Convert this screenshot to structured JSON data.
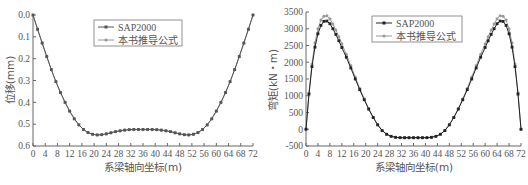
{
  "chart_data": [
    {
      "type": "line",
      "title": "",
      "xlabel": "系梁轴向坐标(m)",
      "ylabel": "位移(mm)",
      "xlim": [
        0,
        72
      ],
      "ylim": [
        0.0,
        0.6
      ],
      "y_inverted": true,
      "grid": false,
      "legend_position": "upper center",
      "x_ticks": [
        "0",
        "4",
        "8",
        "12",
        "16",
        "20",
        "24",
        "28",
        "32",
        "36",
        "40",
        "44",
        "48",
        "52",
        "56",
        "60",
        "64",
        "68",
        "72"
      ],
      "y_ticks": [
        "0.0",
        "0.1",
        "0.2",
        "0.3",
        "0.4",
        "0.5",
        "0.6"
      ],
      "x": [
        0,
        1.5,
        3,
        4.5,
        6,
        7.5,
        9,
        10.5,
        12,
        13.5,
        15,
        16.5,
        18,
        19.5,
        21,
        22.5,
        24,
        25.5,
        27,
        28.5,
        30,
        31.5,
        33,
        34.5,
        36,
        37.5,
        39,
        40.5,
        42,
        43.5,
        45,
        46.5,
        48,
        49.5,
        51,
        52.5,
        54,
        55.5,
        57,
        58.5,
        60,
        61.5,
        63,
        64.5,
        66,
        67.5,
        69,
        70.5,
        72
      ],
      "series": [
        {
          "name": "SAP2000",
          "marker": "square",
          "color": "#555555",
          "values": [
            0.0,
            0.065,
            0.128,
            0.19,
            0.25,
            0.305,
            0.355,
            0.4,
            0.44,
            0.475,
            0.503,
            0.524,
            0.538,
            0.546,
            0.549,
            0.548,
            0.544,
            0.539,
            0.534,
            0.53,
            0.527,
            0.525,
            0.524,
            0.524,
            0.524,
            0.524,
            0.524,
            0.525,
            0.527,
            0.53,
            0.534,
            0.539,
            0.544,
            0.548,
            0.549,
            0.546,
            0.538,
            0.524,
            0.503,
            0.475,
            0.44,
            0.4,
            0.355,
            0.305,
            0.25,
            0.19,
            0.128,
            0.065,
            0.0
          ]
        },
        {
          "name": "本书推导公式",
          "marker": "circle",
          "color": "#999999",
          "values": [
            0.0,
            0.066,
            0.129,
            0.191,
            0.251,
            0.306,
            0.356,
            0.401,
            0.441,
            0.476,
            0.504,
            0.525,
            0.539,
            0.547,
            0.55,
            0.549,
            0.545,
            0.54,
            0.535,
            0.531,
            0.528,
            0.526,
            0.525,
            0.525,
            0.525,
            0.525,
            0.525,
            0.526,
            0.528,
            0.531,
            0.535,
            0.54,
            0.545,
            0.549,
            0.55,
            0.547,
            0.539,
            0.525,
            0.504,
            0.476,
            0.441,
            0.401,
            0.356,
            0.306,
            0.251,
            0.191,
            0.129,
            0.066,
            0.0
          ]
        }
      ]
    },
    {
      "type": "line",
      "title": "",
      "xlabel": "系梁轴向坐标(m)",
      "ylabel": "弯矩(kN・m)",
      "xlim": [
        0,
        72
      ],
      "ylim": [
        -500,
        3500
      ],
      "grid": false,
      "legend_position": "upper center",
      "x_ticks": [
        "0",
        "4",
        "8",
        "12",
        "16",
        "20",
        "24",
        "28",
        "32",
        "36",
        "40",
        "44",
        "48",
        "52",
        "56",
        "60",
        "64",
        "68",
        "72"
      ],
      "y_ticks": [
        "-500",
        "0",
        "500",
        "1000",
        "1500",
        "2000",
        "2500",
        "3000",
        "3500"
      ],
      "x": [
        0,
        1,
        2,
        3,
        4,
        5,
        6,
        7,
        8,
        9,
        10,
        11,
        12,
        13.5,
        15,
        16.5,
        18,
        19.5,
        21,
        22.5,
        24,
        25.5,
        27,
        28.5,
        30,
        31.5,
        33,
        34.5,
        36,
        37.5,
        39,
        40.5,
        42,
        43.5,
        45,
        46.5,
        48,
        49.5,
        51,
        52.5,
        54,
        55.5,
        57,
        58.5,
        60,
        61,
        62,
        63,
        64,
        65,
        66,
        67,
        68,
        69,
        70,
        71,
        72
      ],
      "series": [
        {
          "name": "SAP2000",
          "marker": "square",
          "color": "#222222",
          "values": [
            0,
            1050,
            1870,
            2450,
            2850,
            3100,
            3220,
            3230,
            3150,
            3000,
            2830,
            2640,
            2440,
            2150,
            1830,
            1500,
            1180,
            880,
            600,
            350,
            130,
            -40,
            -150,
            -210,
            -240,
            -250,
            -250,
            -250,
            -250,
            -250,
            -250,
            -250,
            -240,
            -210,
            -150,
            -40,
            130,
            350,
            600,
            880,
            1180,
            1500,
            1830,
            2150,
            2440,
            2640,
            2830,
            3000,
            3150,
            3230,
            3220,
            3100,
            2850,
            2450,
            1870,
            1050,
            0
          ]
        },
        {
          "name": "本书推导公式",
          "marker": "circle",
          "color": "#999999",
          "values": [
            0,
            1080,
            1950,
            2580,
            3000,
            3260,
            3370,
            3390,
            3300,
            3140,
            2960,
            2760,
            2550,
            2240,
            1900,
            1560,
            1220,
            910,
            620,
            360,
            140,
            -35,
            -150,
            -215,
            -245,
            -255,
            -258,
            -258,
            -258,
            -258,
            -258,
            -255,
            -245,
            -215,
            -150,
            -35,
            140,
            360,
            620,
            910,
            1220,
            1560,
            1900,
            2240,
            2550,
            2760,
            2960,
            3140,
            3300,
            3390,
            3370,
            3260,
            3000,
            2580,
            1950,
            1080,
            0
          ]
        }
      ]
    }
  ],
  "charts": {
    "left": {
      "ylabel": "位移(mm)",
      "xlabel": "系梁轴向坐标(m)",
      "legend": [
        "SAP2000",
        "本书推导公式"
      ]
    },
    "right": {
      "ylabel": "弯矩(kN・m)",
      "xlabel": "系梁轴向坐标(m)",
      "legend": [
        "SAP2000",
        "本书推导公式"
      ]
    }
  }
}
